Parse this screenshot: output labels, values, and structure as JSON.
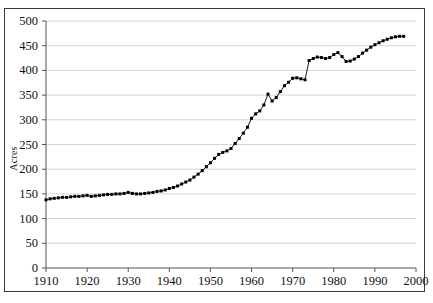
{
  "chart_data": {
    "type": "line",
    "title": "",
    "subtitle": "",
    "xlabel": "",
    "ylabel": "Acres",
    "xlim": [
      1910,
      2000
    ],
    "ylim": [
      0,
      500
    ],
    "ytick_step": 50,
    "xtick_step": 10,
    "yticks": [
      0,
      50,
      100,
      150,
      200,
      250,
      300,
      350,
      400,
      450,
      500
    ],
    "xticks": [
      1910,
      1920,
      1930,
      1940,
      1950,
      1960,
      1970,
      1980,
      1990,
      2000
    ],
    "grid": "horizontal",
    "legend": "none",
    "marker": "square",
    "marker_color": "#000000",
    "line_color": "#000000",
    "grid_color": "#cfcfcf",
    "axis_color": "#555555",
    "border_color": "#3a3a3a",
    "background": "#ffffff",
    "series": [
      {
        "name": "Acres",
        "x": [
          1910,
          1911,
          1912,
          1913,
          1914,
          1915,
          1916,
          1917,
          1918,
          1919,
          1920,
          1921,
          1922,
          1923,
          1924,
          1925,
          1926,
          1927,
          1928,
          1929,
          1930,
          1931,
          1932,
          1933,
          1934,
          1935,
          1936,
          1937,
          1938,
          1939,
          1940,
          1941,
          1942,
          1943,
          1944,
          1945,
          1946,
          1947,
          1948,
          1949,
          1950,
          1951,
          1952,
          1953,
          1954,
          1955,
          1956,
          1957,
          1958,
          1959,
          1960,
          1961,
          1962,
          1963,
          1964,
          1965,
          1966,
          1967,
          1968,
          1969,
          1970,
          1971,
          1972,
          1973,
          1974,
          1975,
          1976,
          1977,
          1978,
          1979,
          1980,
          1981,
          1982,
          1983,
          1984,
          1985,
          1986,
          1987,
          1988,
          1989,
          1990,
          1991,
          1992,
          1993,
          1994,
          1995,
          1996,
          1997
        ],
        "values": [
          138,
          140,
          141,
          142,
          143,
          143,
          144,
          145,
          145,
          146,
          147,
          145,
          146,
          147,
          148,
          149,
          149,
          150,
          150,
          151,
          153,
          151,
          150,
          150,
          151,
          152,
          153,
          155,
          156,
          158,
          161,
          163,
          166,
          170,
          174,
          178,
          184,
          190,
          197,
          205,
          213,
          222,
          230,
          234,
          237,
          242,
          252,
          262,
          273,
          285,
          303,
          312,
          318,
          330,
          352,
          338,
          345,
          357,
          369,
          376,
          384,
          385,
          383,
          381,
          420,
          424,
          427,
          426,
          424,
          426,
          432,
          436,
          428,
          418,
          419,
          423,
          428,
          435,
          441,
          447,
          452,
          456,
          460,
          463,
          466,
          468,
          469,
          469
        ]
      }
    ]
  }
}
